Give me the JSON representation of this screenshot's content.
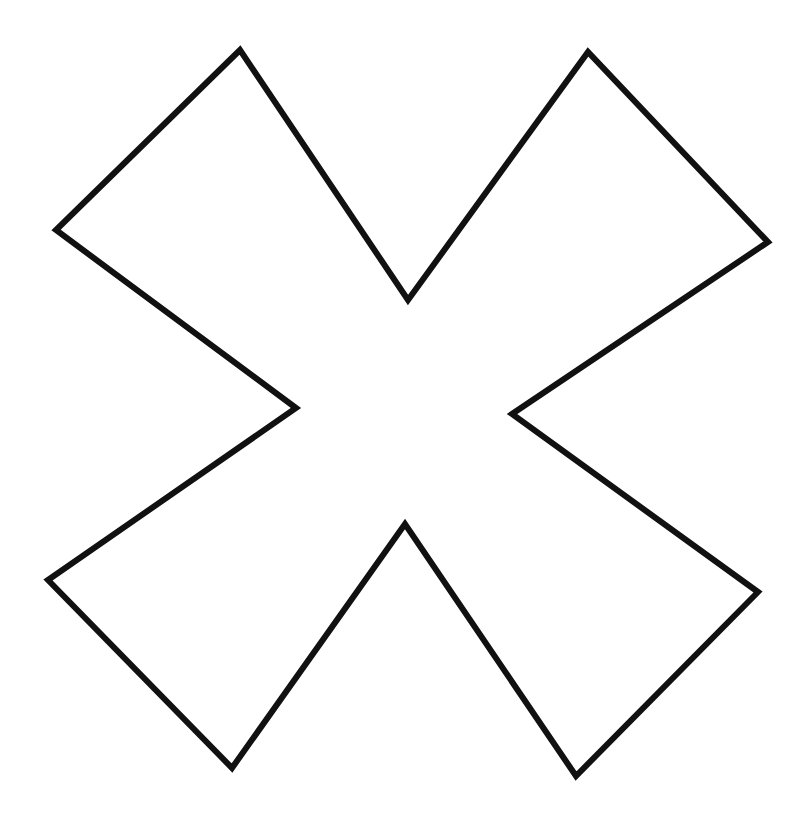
{
  "canvas": {
    "width": 807,
    "height": 828,
    "background": "#ffffff"
  },
  "shape": {
    "name": "cross-x-outline",
    "stroke": "#111111",
    "stroke_width": 6,
    "fill": "#ffffff",
    "points": [
      [
        240,
        50
      ],
      [
        408,
        300
      ],
      [
        588,
        52
      ],
      [
        768,
        242
      ],
      [
        512,
        414
      ],
      [
        758,
        592
      ],
      [
        576,
        776
      ],
      [
        405,
        524
      ],
      [
        232,
        768
      ],
      [
        48,
        580
      ],
      [
        296,
        408
      ],
      [
        56,
        230
      ]
    ]
  }
}
